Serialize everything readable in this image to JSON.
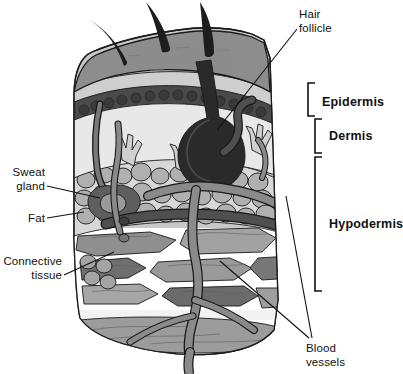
{
  "figure": {
    "background_color": "#ffffff"
  },
  "layer_labels": [
    {
      "id": "epidermis",
      "text": "Epidermis",
      "bold": true,
      "x": 322,
      "y": 103,
      "bracket": {
        "x": 308,
        "top": 83,
        "bottom": 116,
        "tick": 7
      }
    },
    {
      "id": "dermis",
      "text": "Dermis",
      "bold": true,
      "x": 329,
      "y": 137,
      "bracket": {
        "x": 315,
        "top": 119,
        "bottom": 153,
        "tick": 7
      }
    },
    {
      "id": "hypodermis",
      "text": "Hypodermis",
      "bold": true,
      "x": 329,
      "y": 225,
      "bracket": {
        "x": 315,
        "top": 157,
        "bottom": 291,
        "tick": 7
      }
    }
  ],
  "callouts": [
    {
      "id": "hair-follicle",
      "lines": [
        "Hair",
        "follicle"
      ],
      "text_x": 299,
      "text_y": 18,
      "line_height": 14,
      "anchor": "start",
      "leaders": [
        {
          "x1": 297,
          "y1": 29,
          "x2": 217,
          "y2": 130
        }
      ]
    },
    {
      "id": "sweat-gland",
      "lines": [
        "Sweat",
        "gland"
      ],
      "text_x": 45,
      "text_y": 176,
      "line_height": 14,
      "anchor": "end",
      "leaders": [
        {
          "x1": 47,
          "y1": 186,
          "x2": 100,
          "y2": 198
        }
      ]
    },
    {
      "id": "fat",
      "lines": [
        "Fat"
      ],
      "text_x": 45,
      "text_y": 222,
      "line_height": 14,
      "anchor": "end",
      "leaders": [
        {
          "x1": 47,
          "y1": 218,
          "x2": 84,
          "y2": 212
        }
      ]
    },
    {
      "id": "connective-tissue",
      "lines": [
        "Connective",
        "tissue"
      ],
      "text_x": 62,
      "text_y": 265,
      "line_height": 14,
      "anchor": "end",
      "leaders": [
        {
          "x1": 64,
          "y1": 275,
          "x2": 114,
          "y2": 252
        }
      ]
    },
    {
      "id": "blood-vessels",
      "lines": [
        "Blood",
        "vessels"
      ],
      "text_x": 306,
      "text_y": 352,
      "line_height": 14,
      "anchor": "start",
      "leaders": [
        {
          "x1": 309,
          "y1": 338,
          "x2": 220,
          "y2": 261
        },
        {
          "x1": 312,
          "y1": 338,
          "x2": 286,
          "y2": 196
        }
      ]
    }
  ],
  "palette": {
    "epidermis_surface": "#8d8d8d",
    "epidermis_pale": "#d2d2d2",
    "granular_dark": "#4a4a4a",
    "dermis_light": "#e6e6e6",
    "fat_cell": "#a9a9a9",
    "fat_cell_alt": "#bdbdbd",
    "connective_mid": "#9a9a9a",
    "connective_dark": "#6f6f6f",
    "connective_light": "#c4c4c4",
    "vessel_artery": "#8a8a8a",
    "vessel_vein": "#4f4f4f",
    "follicle_dark": "#2a2a2a",
    "hair": "#1d1d1d",
    "outline": "#1a1a1a",
    "white": "#ffffff"
  }
}
